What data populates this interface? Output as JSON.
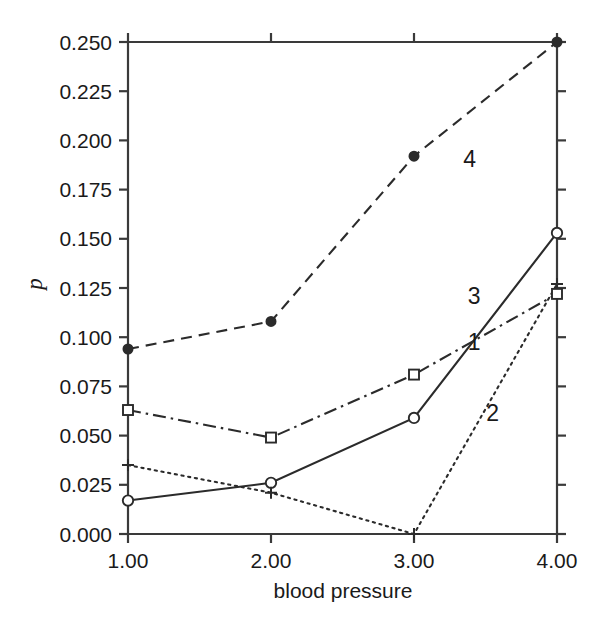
{
  "chart_data": {
    "type": "line",
    "title": "",
    "subtitle": "",
    "xlabel": "blood pressure",
    "ylabel": "p",
    "x": [
      1,
      2,
      3,
      4
    ],
    "xtick_labels": [
      "1.00",
      "2.00",
      "3.00",
      "4.00"
    ],
    "xlim": [
      1,
      4
    ],
    "ylim": [
      0.0,
      0.25
    ],
    "ytick_labels": [
      "0.000",
      "0.025",
      "0.050",
      "0.075",
      "0.100",
      "0.125",
      "0.150",
      "0.175",
      "0.200",
      "0.225",
      "0.250"
    ],
    "ytick_values": [
      0.0,
      0.025,
      0.05,
      0.075,
      0.1,
      0.125,
      0.15,
      0.175,
      0.2,
      0.225,
      0.25
    ],
    "grid": false,
    "legend_position": "inline-annotations",
    "series": [
      {
        "name": "1",
        "label": "1",
        "linestyle": "solid",
        "marker": "open-circle",
        "color": "#2b2b2b",
        "values": [
          0.017,
          0.026,
          0.059,
          0.153
        ],
        "label_x": 3.42,
        "label_y": 0.0935
      },
      {
        "name": "2",
        "label": "2",
        "linestyle": "dotted",
        "marker": "plus",
        "color": "#2b2b2b",
        "values": [
          0.035,
          0.021,
          0.0,
          0.127
        ],
        "label_x": 3.55,
        "label_y": 0.0575
      },
      {
        "name": "3",
        "label": "3",
        "linestyle": "dashdot",
        "marker": "open-square",
        "color": "#2b2b2b",
        "values": [
          0.063,
          0.049,
          0.081,
          0.122
        ],
        "label_x": 3.42,
        "label_y": 0.1168
      },
      {
        "name": "4",
        "label": "4",
        "linestyle": "dashed",
        "marker": "filled-circle",
        "color": "#2b2b2b",
        "values": [
          0.094,
          0.108,
          0.192,
          0.25
        ],
        "label_x": 3.39,
        "label_y": 0.1866
      }
    ]
  },
  "axes": {
    "axis_color": "#3a3a3a",
    "background": "#ffffff"
  }
}
